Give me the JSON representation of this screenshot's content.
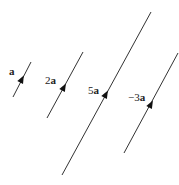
{
  "diagram": {
    "title": "",
    "line_color": "#333333",
    "vectors": [
      {
        "label_coef": "",
        "label_var": "a",
        "x1": 13,
        "y1": 97,
        "x2": 31,
        "y2": 62,
        "arrow_x": 22,
        "arrow_y": 79,
        "direction": "up",
        "label_x": 9,
        "label_y": 75
      },
      {
        "label_coef": "2",
        "label_var": "a",
        "x1": 47,
        "y1": 118,
        "x2": 83,
        "y2": 52,
        "arrow_x": 64,
        "arrow_y": 87,
        "direction": "up",
        "label_x": 45,
        "label_y": 84
      },
      {
        "label_coef": "5",
        "label_var": "a",
        "x1": 62,
        "y1": 175,
        "x2": 151,
        "y2": 12,
        "arrow_x": 106,
        "arrow_y": 94,
        "direction": "up",
        "label_x": 88,
        "label_y": 94
      },
      {
        "label_coef": "−3",
        "label_var": "a",
        "x1": 178,
        "y1": 53,
        "x2": 124,
        "y2": 153,
        "arrow_x": 151,
        "arrow_y": 104,
        "direction": "down",
        "label_x": 128,
        "label_y": 101
      }
    ]
  }
}
